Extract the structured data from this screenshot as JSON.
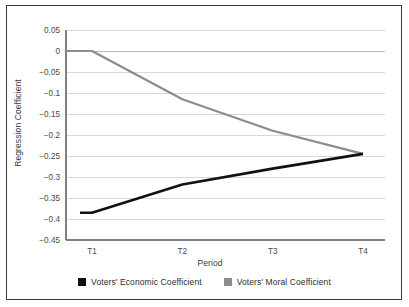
{
  "chart_data": {
    "type": "line",
    "title": "",
    "xlabel": "Period",
    "ylabel": "Regression Coefficient",
    "categories": [
      "T1",
      "T2",
      "T3",
      "T4"
    ],
    "ylim": [
      -0.45,
      0.05
    ],
    "ytick_labels": [
      "0.05",
      "0",
      "−0.05",
      "−0.1",
      "−0.15",
      "−0.2",
      "−0.25",
      "−0.3",
      "−0.35",
      "−0.4",
      "−0.45"
    ],
    "ytick_values": [
      0.05,
      0,
      -0.05,
      -0.1,
      -0.15,
      -0.2,
      -0.25,
      -0.3,
      -0.35,
      -0.4,
      -0.45
    ],
    "grid": "horizontal",
    "legend_position": "bottom",
    "series": [
      {
        "name": "Voters' Economic Coefficient",
        "color": "#111111",
        "values": [
          -0.385,
          -0.318,
          -0.28,
          -0.245
        ]
      },
      {
        "name": "Voters' Moral Coefficient",
        "color": "#8c8c8c",
        "values": [
          0.0,
          -0.115,
          -0.19,
          -0.245
        ]
      }
    ]
  },
  "legend": {
    "items": [
      {
        "label": "Voters' Economic Coefficient",
        "color": "#111111"
      },
      {
        "label": "Voters' Moral Coefficient",
        "color": "#8c8c8c"
      }
    ]
  },
  "colors": {
    "frame": "#3b3b3b",
    "axis": "#808080",
    "gridline": "#d8d8d8",
    "tick_text": "#4a4a4a",
    "background": "#ffffff"
  }
}
